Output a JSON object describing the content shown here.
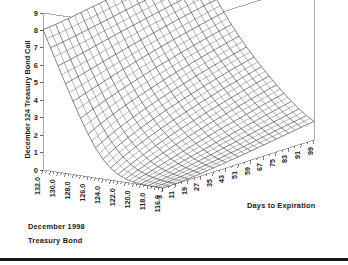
{
  "figure": {
    "type": "surface-3d",
    "background": "#ffffff",
    "mesh_color": "#3a3a3a",
    "frame_color": "#888888",
    "text_color": "#1a1a1a"
  },
  "annotations": {
    "line1": "December 1998",
    "line2": "Treasury Bond"
  },
  "axes": {
    "z": {
      "label": "December 124 Treasury Bond Call",
      "ticks": [
        "0",
        "1",
        "2",
        "3",
        "4",
        "5",
        "6",
        "7",
        "8",
        "9"
      ],
      "range": [
        0,
        9
      ]
    },
    "x": {
      "label": "",
      "ticks": [
        "132.0",
        "130.0",
        "128.0",
        "126.0",
        "124.0",
        "122.0",
        "120.0",
        "118.0",
        "116.0"
      ],
      "range": [
        116,
        132
      ],
      "orientation": "vertical-rotated"
    },
    "y": {
      "label": "Days to Expiration",
      "ticks": [
        "3",
        "11",
        "19",
        "27",
        "35",
        "43",
        "51",
        "59",
        "67",
        "75",
        "83",
        "91",
        "99"
      ],
      "range": [
        3,
        99
      ],
      "orientation": "vertical-rotated"
    }
  },
  "chart_data": {
    "type": "surface",
    "title": "",
    "subtitle": "December 1998 Treasury Bond",
    "xlabel": "Bond Price",
    "ylabel": "Days to Expiration",
    "zlabel": "December 124 Treasury Bond Call",
    "xlim": [
      116,
      132
    ],
    "ylim": [
      3,
      99
    ],
    "zlim": [
      0,
      9
    ],
    "grid": false,
    "legend": "none",
    "strike": 124,
    "x_values": [
      132.0,
      131.0,
      130.0,
      129.0,
      128.0,
      127.0,
      126.0,
      125.0,
      124.0,
      123.0,
      122.0,
      121.0,
      120.0,
      119.0,
      118.0,
      117.0,
      116.0
    ],
    "y_values": [
      3,
      11,
      19,
      27,
      35,
      43,
      51,
      59,
      67,
      75,
      83,
      91,
      99
    ],
    "z_values": [
      [
        8.05,
        8.12,
        8.22,
        8.34,
        8.46,
        8.58,
        8.7,
        8.82,
        8.93,
        9.0,
        9.0,
        9.0,
        9.0
      ],
      [
        7.08,
        7.18,
        7.3,
        7.44,
        7.58,
        7.72,
        7.86,
        8.0,
        8.13,
        8.26,
        8.38,
        8.5,
        8.61
      ],
      [
        6.1,
        6.24,
        6.4,
        6.57,
        6.74,
        6.9,
        7.06,
        7.21,
        7.36,
        7.51,
        7.65,
        7.78,
        7.91
      ],
      [
        5.14,
        5.32,
        5.52,
        5.72,
        5.91,
        6.1,
        6.28,
        6.45,
        6.62,
        6.78,
        6.93,
        7.08,
        7.22
      ],
      [
        4.2,
        4.43,
        4.67,
        4.9,
        5.12,
        5.33,
        5.53,
        5.72,
        5.9,
        6.07,
        6.24,
        6.4,
        6.55
      ],
      [
        3.29,
        3.59,
        3.87,
        4.13,
        4.37,
        4.6,
        4.82,
        5.02,
        5.22,
        5.4,
        5.58,
        5.75,
        5.91
      ],
      [
        2.45,
        2.81,
        3.13,
        3.42,
        3.68,
        3.93,
        4.16,
        4.38,
        4.58,
        4.78,
        4.96,
        5.14,
        5.31
      ],
      [
        1.72,
        2.13,
        2.48,
        2.79,
        3.07,
        3.33,
        3.57,
        3.79,
        4.01,
        4.21,
        4.4,
        4.58,
        4.76
      ],
      [
        1.13,
        1.57,
        1.92,
        2.24,
        2.52,
        2.79,
        3.03,
        3.26,
        3.48,
        3.68,
        3.88,
        4.06,
        4.24
      ],
      [
        0.69,
        1.1,
        1.45,
        1.76,
        2.04,
        2.3,
        2.54,
        2.77,
        2.98,
        3.19,
        3.38,
        3.57,
        3.75
      ],
      [
        0.39,
        0.74,
        1.06,
        1.35,
        1.62,
        1.87,
        2.1,
        2.32,
        2.53,
        2.73,
        2.92,
        3.11,
        3.28
      ],
      [
        0.2,
        0.48,
        0.75,
        1.01,
        1.25,
        1.48,
        1.7,
        1.91,
        2.11,
        2.3,
        2.49,
        2.67,
        2.84
      ],
      [
        0.09,
        0.3,
        0.51,
        0.73,
        0.94,
        1.15,
        1.34,
        1.54,
        1.72,
        1.9,
        2.08,
        2.25,
        2.41
      ],
      [
        0.03,
        0.18,
        0.34,
        0.51,
        0.69,
        0.86,
        1.04,
        1.21,
        1.38,
        1.54,
        1.7,
        1.86,
        2.02
      ],
      [
        0.01,
        0.1,
        0.21,
        0.35,
        0.49,
        0.63,
        0.78,
        0.93,
        1.08,
        1.23,
        1.37,
        1.51,
        1.66
      ],
      [
        0.0,
        0.05,
        0.13,
        0.23,
        0.34,
        0.45,
        0.58,
        0.7,
        0.83,
        0.96,
        1.09,
        1.21,
        1.34
      ],
      [
        0.0,
        0.02,
        0.07,
        0.14,
        0.23,
        0.32,
        0.42,
        0.52,
        0.63,
        0.74,
        0.85,
        0.96,
        1.07
      ]
    ]
  }
}
